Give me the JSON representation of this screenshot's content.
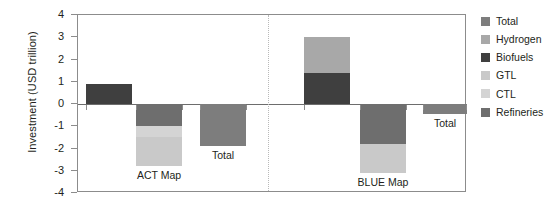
{
  "chart_data": {
    "type": "bar",
    "title": "",
    "subtitle": "",
    "xlabel": "",
    "ylabel": "Investment (USD trillion)",
    "ylim": [
      -4,
      4
    ],
    "ytick_labels": [
      "4",
      "3",
      "2",
      "1",
      "0",
      "-1",
      "-2",
      "-3",
      "-4"
    ],
    "ytick_values": [
      4,
      3,
      2,
      1,
      0,
      -1,
      -2,
      -3,
      -4
    ],
    "grid": false,
    "stacked": true,
    "legend_position": "right",
    "legend": [
      {
        "label": "Total",
        "color": "#7d7d7d"
      },
      {
        "label": "Hydrogen",
        "color": "#a8a8a8"
      },
      {
        "label": "Biofuels",
        "color": "#3f3f3f"
      },
      {
        "label": "GTL",
        "color": "#c9c9c9"
      },
      {
        "label": "CTL",
        "color": "#d4d4d4"
      },
      {
        "label": "Refineries",
        "color": "#6e6e6e"
      }
    ],
    "scenarios": [
      {
        "name": "ACT Map",
        "label": "ACT Map",
        "bars": [
          {
            "name": "act-positive",
            "label": "",
            "segments": [
              {
                "series": "Biofuels",
                "value": 0.9,
                "start": 0,
                "end": 0.9,
                "color": "#3f3f3f"
              }
            ]
          },
          {
            "name": "act-negative",
            "label": "ACT Map",
            "segments": [
              {
                "series": "Refineries",
                "value": -1.0,
                "start": 0,
                "end": -1.0,
                "color": "#6e6e6e"
              },
              {
                "series": "CTL",
                "value": -0.5,
                "start": -1.0,
                "end": -1.5,
                "color": "#d4d4d4"
              },
              {
                "series": "GTL",
                "value": -1.3,
                "start": -1.5,
                "end": -2.8,
                "color": "#c9c9c9"
              }
            ]
          },
          {
            "name": "act-total",
            "label": "Total",
            "segments": [
              {
                "series": "Total",
                "value": -1.9,
                "start": 0,
                "end": -1.9,
                "color": "#7d7d7d"
              }
            ]
          }
        ]
      },
      {
        "name": "BLUE Map",
        "label": "BLUE Map",
        "bars": [
          {
            "name": "blue-positive",
            "label": "",
            "segments": [
              {
                "series": "Biofuels",
                "value": 1.4,
                "start": 0,
                "end": 1.4,
                "color": "#3f3f3f"
              },
              {
                "series": "Hydrogen",
                "value": 1.6,
                "start": 1.4,
                "end": 3.0,
                "color": "#a8a8a8"
              }
            ]
          },
          {
            "name": "blue-negative",
            "label": "BLUE Map",
            "segments": [
              {
                "series": "Refineries",
                "value": -1.8,
                "start": 0,
                "end": -1.8,
                "color": "#6e6e6e"
              },
              {
                "series": "GTL",
                "value": -1.3,
                "start": -1.8,
                "end": -3.1,
                "color": "#c9c9c9"
              }
            ]
          },
          {
            "name": "blue-total",
            "label": "Total",
            "segments": [
              {
                "series": "Total",
                "value": -0.45,
                "start": 0,
                "end": -0.45,
                "color": "#7d7d7d"
              }
            ]
          }
        ]
      }
    ]
  }
}
